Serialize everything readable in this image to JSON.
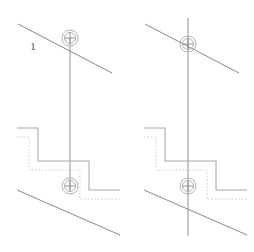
{
  "document": {
    "title": "Technical Drawing - Two Construction Views",
    "type": "cad-line-drawing",
    "width": 254,
    "height": 252,
    "background_color": "#ffffff"
  },
  "colors": {
    "diagonal_line": "#7a7a82",
    "vertical_line": "#9a9aa2",
    "step_solid": "#a8a8ae",
    "step_dotted": "#c8c8ce",
    "marker_circle": "#b0b0b8",
    "marker_cross": "#8a8a92",
    "label_text": "#4a4a4a"
  },
  "panels": [
    {
      "id": "panel-left",
      "name": "left-view",
      "label": "1",
      "label_visible": true,
      "label_position": {
        "x": 33,
        "y": 50
      },
      "upper_diagonal": {
        "x1": 18,
        "y1": 24,
        "x2": 112,
        "y2": 73
      },
      "lower_diagonal": {
        "x1": 17,
        "y1": 190,
        "x2": 120,
        "y2": 235
      },
      "vertical_line": {
        "x": 70,
        "y1": 38,
        "y2": 190
      },
      "top_marker": {
        "cx": 70,
        "cy": 38,
        "r_outer": 8,
        "r_inner": 5.5,
        "cross_len": 11
      },
      "bottom_marker": {
        "cx": 70,
        "cy": 186,
        "r_outer": 8,
        "r_inner": 5.5,
        "cross_len": 11
      },
      "step_solid_points": "17,128 38,128 38,161 89,161 89,190 120,190",
      "step_dotted_points": "17,137 29,137 29,170 80,170 80,199 120,199"
    },
    {
      "id": "panel-right",
      "name": "right-view",
      "label": "",
      "label_visible": false,
      "label_position": {
        "x": 160,
        "y": 50
      },
      "upper_diagonal": {
        "x1": 145,
        "y1": 24,
        "x2": 239,
        "y2": 73
      },
      "lower_diagonal": {
        "x1": 144,
        "y1": 190,
        "x2": 247,
        "y2": 235
      },
      "vertical_line": {
        "x": 188,
        "y1": 18,
        "y2": 236
      },
      "top_marker": {
        "cx": 188,
        "cy": 44,
        "r_outer": 8,
        "r_inner": 5.5,
        "cross_len": 11
      },
      "bottom_marker": {
        "cx": 188,
        "cy": 186,
        "r_outer": 8,
        "r_inner": 5.5,
        "cross_len": 11
      },
      "step_solid_points": "144,128 165,128 165,161 216,161 216,190 247,190",
      "step_dotted_points": "144,137 156,137 156,170 207,170 207,199 247,199"
    }
  ]
}
